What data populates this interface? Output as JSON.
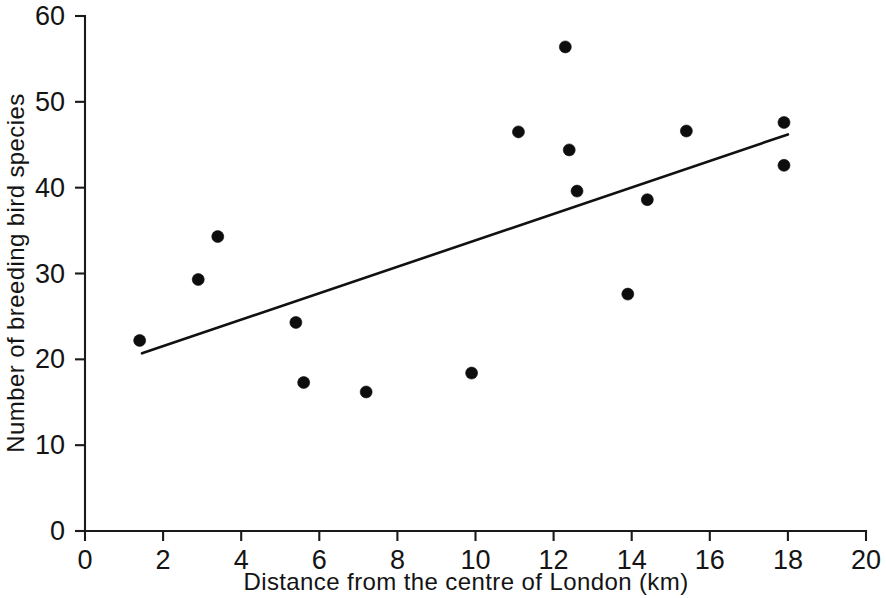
{
  "chart_data": {
    "type": "scatter",
    "title": "",
    "xlabel": "Distance  from  the  centre  of  London  (km)",
    "ylabel": "Number of breeding bird species",
    "xlim": [
      0,
      20
    ],
    "ylim": [
      0,
      60
    ],
    "xticks": [
      0,
      2,
      4,
      6,
      8,
      10,
      12,
      14,
      16,
      18,
      20
    ],
    "xtick_labels": [
      "0",
      "2",
      "4",
      "6",
      "8",
      "10",
      "12",
      "14",
      "16",
      "18",
      "20"
    ],
    "yticks": [
      0,
      10,
      20,
      30,
      40,
      50,
      60
    ],
    "ytick_labels": [
      "0",
      "10",
      "20",
      "30",
      "40",
      "50",
      "60"
    ],
    "grid": false,
    "legend": false,
    "marker": "filled-circle",
    "marker_color": "#0d0d0d",
    "marker_size_px": 12,
    "points": [
      {
        "x": 1.4,
        "y": 22.2
      },
      {
        "x": 2.9,
        "y": 29.3
      },
      {
        "x": 3.4,
        "y": 34.3
      },
      {
        "x": 5.4,
        "y": 24.3
      },
      {
        "x": 5.6,
        "y": 17.3
      },
      {
        "x": 7.2,
        "y": 16.2
      },
      {
        "x": 9.9,
        "y": 18.4
      },
      {
        "x": 11.1,
        "y": 46.5
      },
      {
        "x": 12.3,
        "y": 56.4
      },
      {
        "x": 12.4,
        "y": 44.4
      },
      {
        "x": 12.6,
        "y": 39.6
      },
      {
        "x": 13.9,
        "y": 27.6
      },
      {
        "x": 14.4,
        "y": 38.6
      },
      {
        "x": 15.4,
        "y": 46.6
      },
      {
        "x": 17.9,
        "y": 47.6
      },
      {
        "x": 17.9,
        "y": 42.6
      }
    ],
    "trend_line": {
      "name": "regression line",
      "color": "#111111",
      "x_start": 1.46,
      "y_start": 20.7,
      "x_end": 18.0,
      "y_end": 46.2
    }
  }
}
